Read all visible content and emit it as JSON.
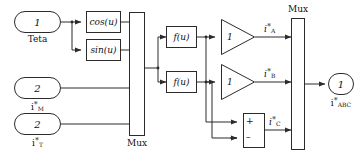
{
  "diagram": {
    "type": "simulink-block-diagram",
    "stroke_color": "#2b2b2b",
    "background": "#ffffff"
  },
  "inputs": [
    {
      "port_number": "1",
      "label": "Teta"
    },
    {
      "port_number": "2",
      "label_base": "i",
      "label_star": "*",
      "label_sub": "M"
    },
    {
      "port_number": "2",
      "label_base": "i",
      "label_star": "*",
      "label_sub": "T"
    }
  ],
  "blocks": {
    "cos": "cos(u)",
    "sin": "sin(u)",
    "fu_top": "f(u)",
    "fu_bottom": "f(u)",
    "gain_a": "1",
    "gain_b": "1",
    "sum_plus": "+",
    "sum_minus": "–"
  },
  "mux": {
    "left_label": "Mux",
    "right_label": "Mux"
  },
  "signals": {
    "a": {
      "base": "i",
      "star": "*",
      "sub": "A"
    },
    "b": {
      "base": "i",
      "star": "*",
      "sub": "B"
    },
    "c": {
      "base": "i",
      "star": "*",
      "sub": "C"
    }
  },
  "output": {
    "port_number": "1",
    "label_base": "i",
    "label_star": "*",
    "label_sub": "ABC"
  }
}
